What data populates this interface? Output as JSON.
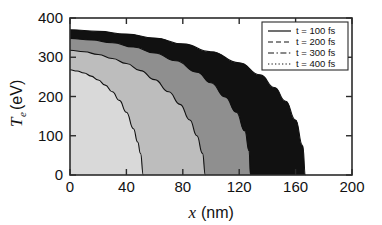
{
  "figure": {
    "background_color": "#ffffff",
    "frame_color": "#2b2b2b"
  },
  "legend": {
    "position": "top-right",
    "entries": [
      {
        "label": "t = 100 fs",
        "style": "solid",
        "sample": "solid-line-sample"
      },
      {
        "label": "t = 200 fs",
        "style": "dashed",
        "sample": "dashed-line-sample"
      },
      {
        "label": "t = 300 fs",
        "style": "dashdot",
        "sample": "dashdot-line-sample"
      },
      {
        "label": "t = 400 fs",
        "style": "dotted",
        "sample": "dotted-line-sample"
      }
    ]
  },
  "axes": {
    "x": {
      "title_symbol": "x",
      "title_unit": "(nm)",
      "title_full": "x (nm)",
      "min": 0,
      "max": 200,
      "ticks": [
        0,
        40,
        80,
        120,
        160,
        200
      ],
      "tick_labels": [
        "0",
        "40",
        "80",
        "120",
        "160",
        "200"
      ]
    },
    "y": {
      "title_symbol": "T",
      "title_subscript": "e",
      "title_unit": "(eV)",
      "title_full": "T_e (eV)",
      "min": 0,
      "max": 400,
      "ticks": [
        0,
        100,
        200,
        300,
        400
      ],
      "tick_labels": [
        "0",
        "100",
        "200",
        "300",
        "400"
      ]
    }
  },
  "chart_data": {
    "type": "line",
    "title": "",
    "subtitle": "",
    "xlabel": "x (nm)",
    "ylabel": "T_e (eV)",
    "xlim": [
      0,
      200
    ],
    "ylim": [
      0,
      400
    ],
    "xticks": [
      0,
      40,
      80,
      120,
      160,
      200
    ],
    "yticks": [
      0,
      100,
      200,
      300,
      400
    ],
    "grid": false,
    "legend_position": "top-right",
    "shaded_bands": true,
    "band_fills": [
      "#d9d9d9",
      "#bdbdbd",
      "#8f8f8f",
      "#111111"
    ],
    "series": [
      {
        "name": "t = 100 fs",
        "style": "solid",
        "fill": "#d9d9d9",
        "x": [
          0,
          5,
          10,
          15,
          20,
          25,
          30,
          35,
          40,
          45,
          48,
          50,
          52
        ],
        "values": [
          268,
          265,
          260,
          252,
          242,
          229,
          212,
          190,
          160,
          118,
          84,
          55,
          0
        ]
      },
      {
        "name": "t = 200 fs",
        "style": "dashed",
        "fill": "#bdbdbd",
        "x": [
          0,
          10,
          20,
          30,
          40,
          50,
          60,
          70,
          78,
          85,
          90,
          94,
          96
        ],
        "values": [
          318,
          314,
          307,
          297,
          284,
          266,
          243,
          212,
          180,
          140,
          100,
          55,
          0
        ]
      },
      {
        "name": "t = 300 fs",
        "style": "dashdot",
        "fill": "#8f8f8f",
        "x": [
          0,
          15,
          30,
          45,
          60,
          75,
          90,
          100,
          110,
          118,
          124,
          127,
          128
        ],
        "values": [
          348,
          344,
          337,
          326,
          311,
          291,
          262,
          235,
          199,
          160,
          112,
          62,
          0
        ]
      },
      {
        "name": "t = 400 fs",
        "style": "dotted",
        "fill": "#111111",
        "x": [
          0,
          20,
          40,
          60,
          80,
          100,
          120,
          135,
          145,
          153,
          160,
          165,
          167
        ],
        "values": [
          370,
          366,
          359,
          349,
          334,
          314,
          286,
          255,
          223,
          188,
          140,
          75,
          0
        ]
      }
    ]
  }
}
